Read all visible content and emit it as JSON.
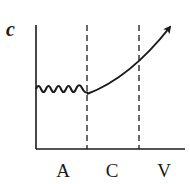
{
  "diagram": {
    "y_axis_label": "c",
    "regions": [
      {
        "label": "A"
      },
      {
        "label": "C"
      },
      {
        "label": "V"
      }
    ],
    "colors": {
      "line": "#1a1a1a",
      "background": "#ffffff"
    }
  }
}
